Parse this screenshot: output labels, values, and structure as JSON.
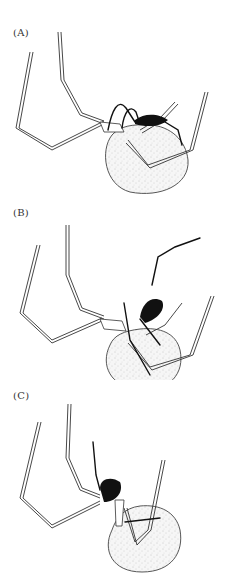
{
  "figure": {
    "panels": [
      {
        "label": "(A)",
        "subject": "spider-with-egg-sac-abdomen",
        "pose": "legs raised, dark male on abdomen top"
      },
      {
        "label": "(B)",
        "subject": "spider-with-egg-sac-abdomen",
        "pose": "dark male climbing with long extended legs"
      },
      {
        "label": "(C)",
        "subject": "spider-with-egg-sac-abdomen",
        "pose": "dark male near cephalothorax, legs crossing abdomen"
      }
    ]
  },
  "colors": {
    "line": "#333333",
    "dark_body": "#111111",
    "abdomen_fill": "#f2f2f2",
    "background": "#ffffff"
  }
}
